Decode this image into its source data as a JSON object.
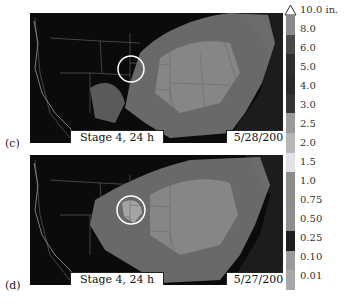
{
  "figure": {
    "panels": [
      {
        "letter": "(c)",
        "product": "Stage 4, 24 h",
        "date": "5/28/2009"
      },
      {
        "letter": "(d)",
        "product": "Stage 4, 24 h",
        "date": "5/27/2009"
      }
    ],
    "colorbar": {
      "unit": "in.",
      "labels": [
        "10.0 in.",
        "8.0",
        "6.0",
        "5.0",
        "4.0",
        "3.0",
        "2.5",
        "2.0",
        "1.5",
        "1.0",
        "0.75",
        "0.50",
        "0.25",
        "0.10",
        "0.01"
      ],
      "colors": [
        "#8a8a8a",
        "#4a4a4a",
        "#2e2e2e",
        "#2a2a2a",
        "#343434",
        "#9a9a9a",
        "#b8b8b8",
        "#e2e2e2",
        "#8c8c8c",
        "#8c8c8c",
        "#8e8e8e",
        "#1e1e1e",
        "#9a9a9a",
        "#a8a8a8"
      ],
      "overflow_marker": "triangle-up"
    }
  }
}
